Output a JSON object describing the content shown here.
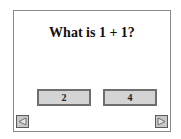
{
  "question": {
    "text": "What is 1 + 1?"
  },
  "answers": [
    {
      "label": "2"
    },
    {
      "label": "4"
    }
  ],
  "navigation": {
    "prev_icon": "left-triangle-arrow",
    "next_icon": "right-triangle-arrow"
  },
  "colors": {
    "frame_border": "#8a8a8a",
    "button_fill": "#d4d4d4",
    "button_border": "#6e6e6e",
    "nav_fill": "#c8c8c8"
  }
}
